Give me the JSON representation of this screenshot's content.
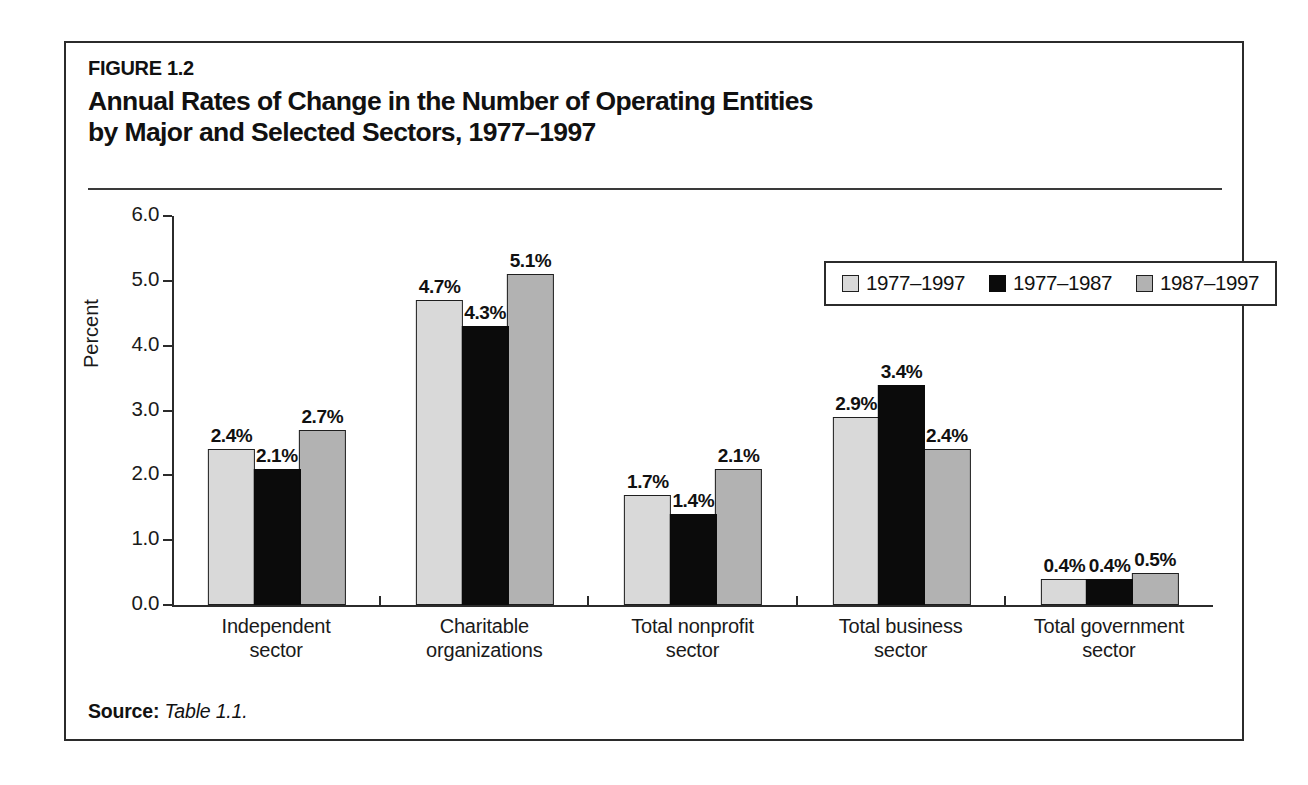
{
  "figure": {
    "number": "FIGURE 1.2",
    "title": "Annual Rates of Change in the Number of Operating Entities\nby Major and Selected Sectors, 1977–1997"
  },
  "source": {
    "label": "Source:",
    "value": "Table 1.1."
  },
  "colors": {
    "series_1977_1997": "#d9d9d9",
    "series_1977_1987": "#0b0b0b",
    "series_1987_1997": "#b2b2b2",
    "frame": "#2b2b2b",
    "text": "#111111"
  },
  "chart_data": {
    "type": "bar",
    "title": "Annual Rates of Change in the Number of Operating Entities by Major and Selected Sectors, 1977–1997",
    "xlabel": "",
    "ylabel": "Percent",
    "ylim": [
      0.0,
      6.0
    ],
    "ytick_labels": [
      "0.0",
      "1.0",
      "2.0",
      "3.0",
      "4.0",
      "5.0",
      "6.0"
    ],
    "yticks": [
      0.0,
      1.0,
      2.0,
      3.0,
      4.0,
      5.0,
      6.0
    ],
    "grid": false,
    "legend_position": "top-right",
    "categories": [
      "Independent\nsector",
      "Charitable\norganizations",
      "Total nonprofit\nsector",
      "Total business\nsector",
      "Total government\nsector"
    ],
    "series": [
      {
        "name": "1977–1997",
        "values": [
          2.4,
          4.7,
          1.7,
          2.9,
          0.4
        ],
        "labels": [
          "2.4%",
          "4.7%",
          "1.7%",
          "2.9%",
          "0.4%"
        ]
      },
      {
        "name": "1977–1987",
        "values": [
          2.1,
          4.3,
          1.4,
          3.4,
          0.4
        ],
        "labels": [
          "2.1%",
          "4.3%",
          "1.4%",
          "3.4%",
          "0.4%"
        ]
      },
      {
        "name": "1987–1997",
        "values": [
          2.7,
          5.1,
          2.1,
          2.4,
          0.5
        ],
        "labels": [
          "2.7%",
          "5.1%",
          "2.1%",
          "2.4%",
          "0.5%"
        ]
      }
    ]
  }
}
